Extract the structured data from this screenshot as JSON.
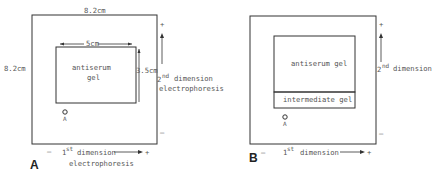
{
  "panel_a": {
    "label": "A",
    "outer_width_label": "8.2cm",
    "outer_height_label": "8.2cm",
    "gel_width_label": "5cm",
    "gel_height_label": "3.5cm",
    "gel_label_line1": "antiserum",
    "gel_label_line2": "gel",
    "well_label": "A",
    "dim2_label": "2",
    "dim2_sup": "nd",
    "dim2_word": "dimension",
    "dim2_sub": "electrophoresis",
    "dim1_label": "1",
    "dim1_sup": "st",
    "dim1_word": "dimension",
    "dim1_sub": "electrophoresis",
    "plus": "+",
    "minus": "–"
  },
  "panel_b": {
    "label": "B",
    "gel_label": "antiserum gel",
    "intermediate_label": "intermediate gel",
    "well_label": "A",
    "dim2_label": "2",
    "dim2_sup": "nd",
    "dim2_word": "dimension",
    "dim1_label": "1",
    "dim1_sup": "st",
    "dim1_word": "dimension",
    "plus": "+",
    "minus": "–"
  }
}
